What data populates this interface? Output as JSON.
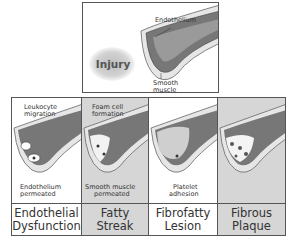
{
  "top_panel": {
    "injury_label": "Injury",
    "annotations": {
      "endothelium": "Endothelium",
      "smooth_muscle_line1": "Smooth",
      "smooth_muscle_line2": "muscle"
    }
  },
  "stages": [
    {
      "id": "endothelial-dysfunction",
      "label_line1": "Endothelial",
      "label_line2": "Dysfunction",
      "top_note_line1": "Leukocyte",
      "top_note_line2": "migration",
      "bottom_note_line1": "Endothelium",
      "bottom_note_line2": "permeated",
      "background": "#ffffff"
    },
    {
      "id": "fatty-streak",
      "label_line1": "Fatty",
      "label_line2": "Streak",
      "top_note_line1": "Foam cell",
      "top_note_line2": "formation",
      "bottom_note_line1": "Smooth muscle",
      "bottom_note_line2": "permeated",
      "background": "#d6d6d6"
    },
    {
      "id": "fibrofatty-lesion",
      "label_line1": "Fibrofatty",
      "label_line2": "Lesion",
      "bottom_note_line1": "Platelet",
      "bottom_note_line2": "adhesion",
      "background": "#ffffff"
    },
    {
      "id": "fibrous-plaque",
      "label_line1": "Fibrous",
      "label_line2": "Plaque",
      "background": "#d6d6d6"
    }
  ]
}
